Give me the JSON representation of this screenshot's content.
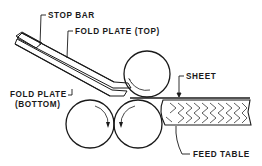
{
  "diagram": {
    "type": "mechanical-illustration",
    "labels": {
      "stop_bar": "STOP BAR",
      "fold_plate_top": "FOLD PLATE (TOP)",
      "fold_plate_bottom_line1": "FOLD PLATE",
      "fold_plate_bottom_line2": "(BOTTOM)",
      "sheet": "SHEET",
      "feed_table": "FEED TABLE"
    },
    "components": [
      {
        "name": "stop-bar",
        "label": "STOP BAR"
      },
      {
        "name": "fold-plate-top",
        "label": "FOLD PLATE (TOP)"
      },
      {
        "name": "fold-plate-bottom",
        "label": "FOLD PLATE (BOTTOM)"
      },
      {
        "name": "top-roller"
      },
      {
        "name": "bottom-left-roller"
      },
      {
        "name": "bottom-right-roller"
      },
      {
        "name": "sheet",
        "label": "SHEET"
      },
      {
        "name": "feed-table",
        "label": "FEED TABLE"
      }
    ],
    "colors": {
      "ink": "#1a1a1a",
      "background": "#ffffff"
    }
  }
}
